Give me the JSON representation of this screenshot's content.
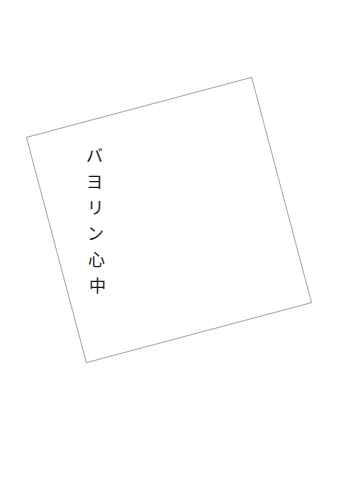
{
  "page": {
    "background_color": "#ffffff",
    "width": 338,
    "height": 482
  },
  "card": {
    "name": "book-cover-card",
    "fill_color": "#ffffff",
    "border_color": "#a8a8ac",
    "border_width_px": 1,
    "rotation_deg": -14.9,
    "size_px": 234,
    "corners": {
      "top_left": [
        25,
        128
      ],
      "top_right": [
        251,
        68
      ],
      "bottom_right": [
        312,
        310
      ],
      "bottom_left": [
        85,
        372
      ]
    }
  },
  "title": {
    "full_text": "バヨリン心中",
    "romaji": "Bayorin Shinju",
    "orientation": "vertical",
    "text_color": "#1b1b20",
    "font_style": "serif",
    "font_size_px": 17,
    "characters": [
      {
        "char": "バ"
      },
      {
        "char": "ヨ"
      },
      {
        "char": "リ"
      },
      {
        "char": "ン"
      },
      {
        "char": "心"
      },
      {
        "char": "中"
      }
    ]
  }
}
